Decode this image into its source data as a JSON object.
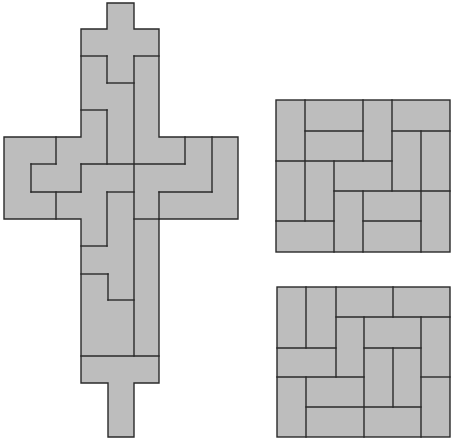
{
  "canvas": {
    "width": 457,
    "height": 445,
    "background": "#ffffff"
  },
  "colors": {
    "fill": "#bdbdbd",
    "stroke": "#2a2a2a"
  },
  "figures": [
    {
      "id": "cross",
      "label": "cross-shaped dissection",
      "outline": "107,3 134,3 134,29 159,29 159,137 238,137 238,219 159,219 159,356 159,383 134,383 134,437 108,437 108,383 81,383 81,356 81,219 4,219 4,137 81,137 81,29 107,29",
      "lines": [
        [
          81,
          56,
          107,
          56
        ],
        [
          134,
          56,
          159,
          56
        ],
        [
          107,
          56,
          107,
          83
        ],
        [
          107,
          83,
          134,
          83
        ],
        [
          134,
          56,
          134,
          356
        ],
        [
          81,
          110,
          107,
          110
        ],
        [
          107,
          110,
          107,
          164
        ],
        [
          56,
          137,
          56,
          164
        ],
        [
          31,
          164,
          56,
          164
        ],
        [
          31,
          164,
          31,
          192
        ],
        [
          81,
          164,
          185,
          164
        ],
        [
          185,
          137,
          185,
          164
        ],
        [
          31,
          192,
          81,
          192
        ],
        [
          81,
          164,
          81,
          192
        ],
        [
          56,
          192,
          56,
          219
        ],
        [
          212,
          137,
          212,
          192
        ],
        [
          159,
          192,
          212,
          192
        ],
        [
          107,
          192,
          134,
          192
        ],
        [
          107,
          192,
          107,
          246
        ],
        [
          81,
          246,
          107,
          246
        ],
        [
          159,
          192,
          159,
          219
        ],
        [
          134,
          219,
          159,
          219
        ],
        [
          81,
          274,
          108,
          274
        ],
        [
          108,
          274,
          108,
          300
        ],
        [
          108,
          300,
          134,
          300
        ],
        [
          81,
          356,
          159,
          356
        ]
      ]
    },
    {
      "id": "square-top",
      "label": "upper square dissection",
      "rect": [
        276,
        100,
        450,
        252
      ],
      "lines": [
        [
          305,
          131,
          363,
          131
        ],
        [
          392,
          131,
          450,
          131
        ],
        [
          276,
          161,
          392,
          161
        ],
        [
          334,
          191,
          450,
          191
        ],
        [
          276,
          221,
          334,
          221
        ],
        [
          363,
          221,
          421,
          221
        ],
        [
          305,
          100,
          305,
          221
        ],
        [
          334,
          161,
          334,
          252
        ],
        [
          363,
          100,
          363,
          161
        ],
        [
          363,
          191,
          363,
          252
        ],
        [
          392,
          100,
          392,
          191
        ],
        [
          421,
          131,
          421,
          252
        ]
      ]
    },
    {
      "id": "square-bottom",
      "label": "lower square dissection",
      "rect": [
        277,
        287,
        450,
        437
      ],
      "lines": [
        [
          336,
          317,
          450,
          317
        ],
        [
          277,
          348,
          336,
          348
        ],
        [
          364,
          348,
          421,
          348
        ],
        [
          277,
          377,
          364,
          377
        ],
        [
          421,
          377,
          450,
          377
        ],
        [
          306,
          407,
          421,
          407
        ],
        [
          306,
          287,
          306,
          348
        ],
        [
          306,
          377,
          306,
          437
        ],
        [
          336,
          287,
          336,
          377
        ],
        [
          364,
          317,
          364,
          437
        ],
        [
          393,
          287,
          393,
          317
        ],
        [
          393,
          348,
          393,
          407
        ],
        [
          421,
          317,
          421,
          437
        ]
      ]
    }
  ]
}
